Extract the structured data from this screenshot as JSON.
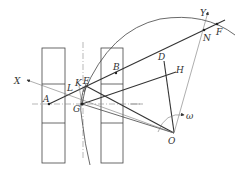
{
  "diagram": {
    "type": "geometric-mechanism-diagram",
    "labels": {
      "X": "X",
      "Y": "Y",
      "A": "A",
      "B": "B",
      "D": "D",
      "E": "E",
      "F": "F",
      "G": "G",
      "H": "H",
      "K": "K",
      "L": "L",
      "N": "N",
      "O": "O",
      "omega": "ω"
    },
    "colors": {
      "line": "#444444",
      "background": "#ffffff"
    }
  }
}
